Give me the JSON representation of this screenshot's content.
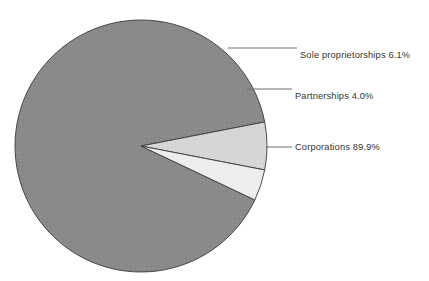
{
  "figure": {
    "background_color": "#ffffff",
    "width": 429,
    "height": 281
  },
  "chart_data": {
    "type": "pie",
    "title": "",
    "subtitle": "",
    "xlabel": "",
    "ylabel": "",
    "grid": false,
    "legend_position": "callout-labels-right",
    "label_format": "name value%",
    "units": "percent",
    "total": 100.0,
    "categories": [
      "Sole proprietorships",
      "Partnerships",
      "Corporations"
    ],
    "values": [
      6.1,
      4.0,
      89.9
    ],
    "colors": [
      "#d6d6d6",
      "#ededed",
      "#8a8a8a"
    ],
    "slice_edge_color": "#3a3a3a",
    "leader_line_color": "#6f6f6f",
    "start_angle_deg": -11,
    "direction": "clockwise",
    "slices": [
      {
        "name": "Sole proprietorships",
        "value": 6.1,
        "label": "Sole proprietorships 6.1%",
        "color": "#d6d6d6",
        "start_angle_deg": -11.0,
        "end_angle_deg": 10.96
      },
      {
        "name": "Partnerships",
        "value": 4.0,
        "label": "Partnerships 4.0%",
        "color": "#ededed",
        "start_angle_deg": 10.96,
        "end_angle_deg": 25.36
      },
      {
        "name": "Corporations",
        "value": 89.9,
        "label": "Corporations 89.9%",
        "color": "#8a8a8a",
        "start_angle_deg": 25.36,
        "end_angle_deg": 349.0
      }
    ],
    "annotations": [
      {
        "name": "sole-proprietorships",
        "text": "Sole proprietorships 6.1%",
        "text_x": 299,
        "text_y": 55,
        "leader_points": "228,48 297,48"
      },
      {
        "name": "partnerships",
        "text": "Partnerships 4.0%",
        "text_x": 294,
        "text_y": 96,
        "leader_points": "247,89 269,89 292,89"
      },
      {
        "name": "corporations",
        "text": "Corporations 89.9%",
        "text_x": 294,
        "text_y": 147,
        "leader_points": "266,147 292,147"
      }
    ],
    "geometry": {
      "center_x": 141,
      "center_y": 146,
      "radius": 126
    }
  }
}
